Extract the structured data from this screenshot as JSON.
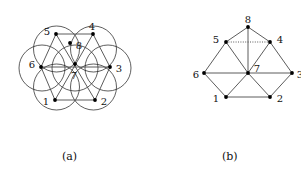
{
  "figure": {
    "panels": [
      {
        "id": "a",
        "caption": "(a)",
        "kind": "circle-packing-intersection-graph",
        "description": "Seven unit circles arranged in a flower (hexagonal) packing with the graph of tangency/centers drawn on top.",
        "circles": {
          "count": 7,
          "radius": 23,
          "centers": [
            {
              "name": "center",
              "cx": 75,
              "cy": 68
            },
            {
              "name": "upper-left",
              "cx": 56.5,
              "cy": 49
            },
            {
              "name": "upper-right",
              "cx": 93.5,
              "cy": 49
            },
            {
              "name": "left",
              "cx": 42,
              "cy": 68
            },
            {
              "name": "right",
              "cx": 108,
              "cy": 68
            },
            {
              "name": "lower-left",
              "cx": 56.5,
              "cy": 87
            },
            {
              "name": "lower-right",
              "cx": 93.5,
              "cy": 87
            }
          ],
          "stroke": "#1a1a1a",
          "fill": "none"
        },
        "vertices": [
          {
            "label": "1",
            "x": 55,
            "y": 100,
            "label_dx": -9,
            "label_dy": 1
          },
          {
            "label": "2",
            "x": 95,
            "y": 100,
            "label_dx": 9,
            "label_dy": 1
          },
          {
            "label": "3",
            "x": 110,
            "y": 67,
            "label_dx": 9,
            "label_dy": 1
          },
          {
            "label": "4",
            "x": 93,
            "y": 34,
            "label_dx": -1,
            "label_dy": -8
          },
          {
            "label": "5",
            "x": 56,
            "y": 34,
            "label_dx": -9,
            "label_dy": -3
          },
          {
            "label": "6",
            "x": 41,
            "y": 67,
            "label_dx": -9,
            "label_dy": -3
          },
          {
            "label": "7",
            "x": 75,
            "y": 64,
            "label_dx": -1,
            "label_dy": 11
          },
          {
            "label": "8",
            "x": 70,
            "y": 43,
            "label_dx": 9,
            "label_dy": 2
          }
        ],
        "edges": [
          {
            "from": "1",
            "to": "2",
            "style": "solid"
          },
          {
            "from": "2",
            "to": "3",
            "style": "solid"
          },
          {
            "from": "3",
            "to": "4",
            "style": "solid"
          },
          {
            "from": "4",
            "to": "5",
            "style": "solid"
          },
          {
            "from": "5",
            "to": "6",
            "style": "solid"
          },
          {
            "from": "6",
            "to": "1",
            "style": "solid"
          },
          {
            "from": "1",
            "to": "4",
            "style": "solid"
          },
          {
            "from": "2",
            "to": "5",
            "style": "solid"
          },
          {
            "from": "3",
            "to": "6",
            "style": "solid"
          }
        ]
      },
      {
        "id": "b",
        "caption": "(b)",
        "kind": "graph",
        "description": "Hexagonal wheel graph with hub 7 and extra apex vertex 8 above edge 5-4; edge 5-4 is drawn dotted.",
        "vertices": [
          {
            "label": "1",
            "x": 226,
            "y": 97,
            "label_dx": -10,
            "label_dy": 1
          },
          {
            "label": "2",
            "x": 270,
            "y": 97,
            "label_dx": 10,
            "label_dy": 1
          },
          {
            "label": "3",
            "x": 292,
            "y": 73,
            "label_dx": 8,
            "label_dy": 1
          },
          {
            "label": "4",
            "x": 270,
            "y": 42,
            "label_dx": 10,
            "label_dy": -3
          },
          {
            "label": "5",
            "x": 226,
            "y": 42,
            "label_dx": -10,
            "label_dy": -3
          },
          {
            "label": "6",
            "x": 204,
            "y": 73,
            "label_dx": -8,
            "label_dy": 1
          },
          {
            "label": "7",
            "x": 248,
            "y": 73,
            "label_dx": 9,
            "label_dy": -5
          },
          {
            "label": "8",
            "x": 248,
            "y": 27,
            "label_dx": 0,
            "label_dy": -8
          }
        ],
        "edges": [
          {
            "from": "1",
            "to": "2",
            "style": "solid"
          },
          {
            "from": "2",
            "to": "3",
            "style": "solid"
          },
          {
            "from": "3",
            "to": "4",
            "style": "solid"
          },
          {
            "from": "5",
            "to": "6",
            "style": "solid"
          },
          {
            "from": "6",
            "to": "1",
            "style": "solid"
          },
          {
            "from": "5",
            "to": "4",
            "style": "dotted"
          },
          {
            "from": "7",
            "to": "1",
            "style": "solid"
          },
          {
            "from": "7",
            "to": "2",
            "style": "solid"
          },
          {
            "from": "7",
            "to": "3",
            "style": "solid"
          },
          {
            "from": "7",
            "to": "4",
            "style": "solid"
          },
          {
            "from": "7",
            "to": "5",
            "style": "solid"
          },
          {
            "from": "7",
            "to": "6",
            "style": "solid"
          },
          {
            "from": "8",
            "to": "5",
            "style": "solid"
          },
          {
            "from": "8",
            "to": "4",
            "style": "solid"
          },
          {
            "from": "8",
            "to": "7",
            "style": "solid"
          }
        ]
      }
    ],
    "style": {
      "edge_color": "#4a4a4a",
      "circle_color": "#1a1a1a",
      "vertex_color": "#000000",
      "label_color": "#111111",
      "background": "#ffffff",
      "vertex_radius": 1.9,
      "edge_width": 0.9,
      "circle_width": 0.7
    }
  }
}
